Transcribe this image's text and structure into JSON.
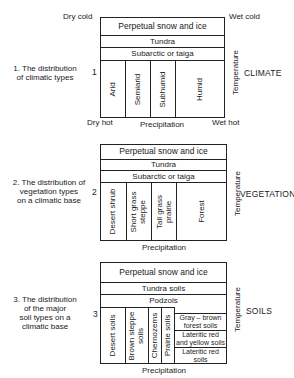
{
  "diagrams": [
    {
      "number": "1",
      "caption_lines": [
        "1. The distribution",
        "of climatic types"
      ],
      "side_label": "CLIMATE",
      "axis_y": "Temperature",
      "axis_x": "Precipitation",
      "corners": {
        "top_left": "Dry cold",
        "top_right": "Wet cold",
        "bottom_left": "Dry hot",
        "bottom_right": "Wet hot"
      },
      "rows": [
        "Perpetual snow and ice",
        "Tundra",
        "Subarctic or taiga"
      ],
      "columns": [
        "Arid",
        "Semiarid",
        "Subhumid",
        "Humid"
      ]
    },
    {
      "number": "2",
      "caption_lines": [
        "2. The distribution of",
        "vegetation types",
        "on a climatic base"
      ],
      "side_label": "VEGETATION",
      "axis_y": "Temperature",
      "axis_x": "Precipitation",
      "rows": [
        "Perpetual snow and ice",
        "Tundra",
        "Subarctic or taiga"
      ],
      "columns": [
        [
          "Desert shrub"
        ],
        [
          "Short grass",
          "steppe"
        ],
        [
          "Tall grass",
          "prairie"
        ],
        [
          "Forest"
        ]
      ]
    },
    {
      "number": "3",
      "caption_lines": [
        "3. The distribution",
        "of the major",
        "soil types on a",
        "climatic base"
      ],
      "side_label": "SOILS",
      "axis_y": "Temperature",
      "axis_x": "Precipitation",
      "rows": [
        "Perpetual snow and ice",
        "Tundra soils",
        "Podzols"
      ],
      "columns": [
        [
          "Desert soils"
        ],
        [
          "Brown steppe",
          "soils"
        ],
        [
          "Chernozems"
        ],
        [
          "Prairie soils"
        ]
      ],
      "right_stack": [
        [
          "Gray – brown",
          "forest soils"
        ],
        [
          "Lateritic red",
          "and yellow soils"
        ],
        [
          "Lateritic red",
          "soils"
        ]
      ]
    }
  ]
}
